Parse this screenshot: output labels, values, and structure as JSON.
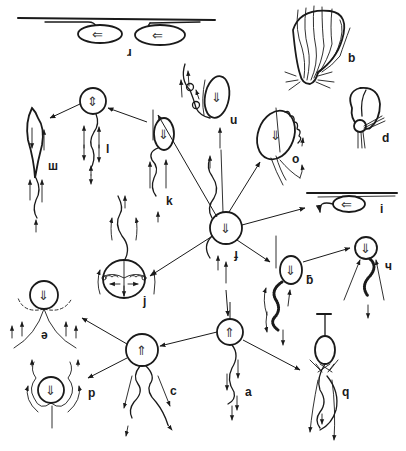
{
  "figure": {
    "labels": {
      "r": "ɹ",
      "b": "b",
      "d": "d",
      "u": "u",
      "o": "o",
      "l": "l",
      "m": "ш",
      "k": "k",
      "f": "ɟ",
      "i": "i",
      "j": "j",
      "g": "ƃ",
      "h": "ч",
      "e": "ə",
      "p": "p",
      "c": "c",
      "a": "a",
      "q": "q"
    },
    "cell_glyphs": {
      "down": "⇓",
      "up": "⇑",
      "left": "⇐",
      "updown": "⇕"
    },
    "colors": {
      "ink": "#1a1a1a",
      "background": "#ffffff"
    }
  }
}
